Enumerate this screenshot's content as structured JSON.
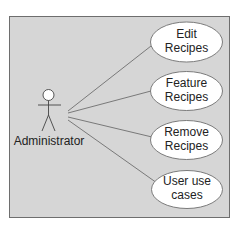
{
  "diagram": {
    "type": "uml-use-case",
    "colors": {
      "background": "#ffffff",
      "boundary_fill": "#d6d6d6",
      "boundary_stroke": "#6e6e6e",
      "ellipse_fill": "#ffffff",
      "ellipse_stroke": "#6e6e6e",
      "line": "#6e6e6e",
      "text": "#222222"
    },
    "actor": {
      "name": "Administrator"
    },
    "use_cases": [
      {
        "line1": "Edit",
        "line2": "Recipes"
      },
      {
        "line1": "Feature",
        "line2": "Recipes"
      },
      {
        "line1": "Remove",
        "line2": "Recipes"
      },
      {
        "line1": "User use",
        "line2": "cases"
      }
    ]
  }
}
